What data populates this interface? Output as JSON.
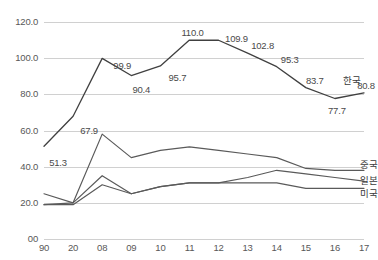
{
  "chart_data": {
    "type": "line",
    "title": "",
    "subtitle": "",
    "xlabel": "",
    "ylabel": "",
    "ylim": [
      0,
      120
    ],
    "xlim_categories": [
      "90",
      "20",
      "08",
      "09",
      "10",
      "11",
      "12",
      "13",
      "14",
      "15",
      "16",
      "17"
    ],
    "categories": [
      "90",
      "20",
      "08",
      "09",
      "10",
      "11",
      "12",
      "13",
      "14",
      "15",
      "16",
      "17"
    ],
    "y_ticks": [
      "00",
      "20.0",
      "40.0",
      "60.0",
      "80.0",
      "100.0",
      "120.0"
    ],
    "y_tick_values": [
      0,
      20,
      40,
      60,
      80,
      100,
      120
    ],
    "grid": true,
    "legend_position": "right-inline",
    "series": [
      {
        "name": "한국",
        "values": [
          51.3,
          67.9,
          99.9,
          90.4,
          95.7,
          110.0,
          109.9,
          102.8,
          95.3,
          83.7,
          77.7,
          80.8
        ],
        "color": "#404040",
        "labeled": true
      },
      {
        "name": "중국",
        "values": [
          25.0,
          20.0,
          58.0,
          45.0,
          49.0,
          51.0,
          49.0,
          47.0,
          45.0,
          39.0,
          38.0,
          38.0
        ],
        "color": "#5a5a5a",
        "labeled": false
      },
      {
        "name": "일본",
        "values": [
          19.0,
          20.0,
          35.0,
          25.0,
          29.0,
          31.0,
          31.0,
          34.0,
          38.0,
          36.0,
          34.0,
          32.0
        ],
        "color": "#5a5a5a",
        "labeled": false
      },
      {
        "name": "미국",
        "values": [
          19.0,
          19.0,
          30.0,
          25.0,
          29.0,
          31.0,
          31.0,
          31.0,
          31.0,
          28.0,
          28.0,
          28.0
        ],
        "color": "#5a5a5a",
        "labeled": false
      }
    ],
    "data_labels": [
      {
        "text": "51.3",
        "x_index": 0,
        "value": 51.3,
        "dx": 14,
        "dy": 16
      },
      {
        "text": "67.9",
        "x_index": 1,
        "value": 67.9,
        "dx": 16,
        "dy": 14
      },
      {
        "text": "99.9",
        "x_index": 2,
        "value": 99.9,
        "dx": 20,
        "dy": 7
      },
      {
        "text": "90.4",
        "x_index": 3,
        "value": 90.4,
        "dx": 10,
        "dy": 13
      },
      {
        "text": "95.7",
        "x_index": 4,
        "value": 95.7,
        "dx": 17,
        "dy": 11
      },
      {
        "text": "110.0",
        "x_index": 5,
        "value": 110.0,
        "dx": 3,
        "dy": -8
      },
      {
        "text": "109.9",
        "x_index": 6,
        "value": 109.9,
        "dx": 18,
        "dy": -2
      },
      {
        "text": "102.8",
        "x_index": 7,
        "value": 102.8,
        "dx": 15,
        "dy": -8
      },
      {
        "text": "95.3",
        "x_index": 8,
        "value": 95.3,
        "dx": 13,
        "dy": -8
      },
      {
        "text": "83.7",
        "x_index": 9,
        "value": 83.7,
        "dx": 9,
        "dy": -8
      },
      {
        "text": "77.7",
        "x_index": 10,
        "value": 77.7,
        "dx": 2,
        "dy": 11
      },
      {
        "text": "80.8",
        "x_index": 11,
        "value": 80.8,
        "dx": 2,
        "dy": -8
      }
    ],
    "series_labels": [
      {
        "text": "한국",
        "x_index": 10,
        "value": 88.0,
        "dx": 8
      },
      {
        "text": "중국",
        "x_index": 11,
        "value": 41.5,
        "dx": -4
      },
      {
        "text": "일본",
        "x_index": 11,
        "value": 32.5,
        "dx": -4
      },
      {
        "text": "미국",
        "x_index": 11,
        "value": 25.5,
        "dx": -4
      }
    ]
  }
}
